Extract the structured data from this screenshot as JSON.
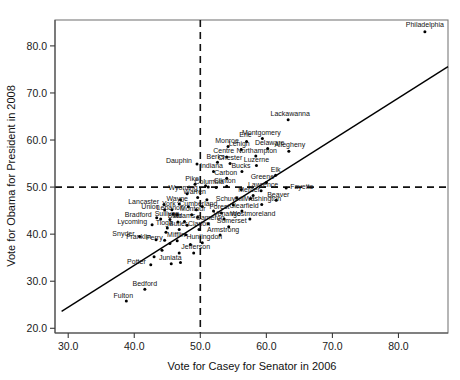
{
  "chart_data": {
    "type": "scatter",
    "title": "",
    "xlabel": "Vote for Casey for Senator in 2006",
    "ylabel": "Vote for Obama for President in 2008",
    "xlim": [
      28.0,
      87.5
    ],
    "ylim": [
      19.0,
      85.5
    ],
    "xticks": [
      "30.0",
      "40.0",
      "50.0",
      "60.0",
      "70.0",
      "80.0"
    ],
    "xtick_values": [
      30,
      40,
      50,
      60,
      70,
      80
    ],
    "yticks": [
      "20.0",
      "30.0",
      "40.0",
      "50.0",
      "60.0",
      "70.0",
      "80.0"
    ],
    "ytick_values": [
      20,
      30,
      40,
      50,
      60,
      70,
      80
    ],
    "grid": false,
    "legend": null,
    "reference_lines": [
      {
        "orientation": "vertical",
        "value": 50,
        "style": "dashed"
      },
      {
        "orientation": "horizontal",
        "value": 50,
        "style": "dashed"
      }
    ],
    "fit_line": {
      "style": "solid",
      "x0": 29.0,
      "y0": 23.6,
      "x1": 87.5,
      "y1": 75.6
    },
    "points": [
      {
        "label": "Philadelphia",
        "x": 84.0,
        "y": 83.0,
        "lx": 0,
        "ly": -5,
        "anchor": "middle"
      },
      {
        "label": "Lackawanna",
        "x": 63.3,
        "y": 64.3,
        "lx": 2,
        "ly": -4,
        "anchor": "middle"
      },
      {
        "label": "Montgomery",
        "x": 59.4,
        "y": 60.3,
        "lx": -1,
        "ly": -4,
        "anchor": "middle"
      },
      {
        "label": "Erie",
        "x": 57.0,
        "y": 59.7,
        "lx": -1,
        "ly": -4,
        "anchor": "middle"
      },
      {
        "label": "Delaware",
        "x": 60.2,
        "y": 58.2,
        "lx": 2,
        "ly": -3.5,
        "anchor": "middle"
      },
      {
        "label": "Allegheny",
        "x": 63.4,
        "y": 57.6,
        "lx": 1,
        "ly": -4,
        "anchor": "middle"
      },
      {
        "label": "Lehigh",
        "x": 56.2,
        "y": 58.0,
        "lx": -2,
        "ly": -3.5,
        "anchor": "middle"
      },
      {
        "label": "Monroe",
        "x": 54.2,
        "y": 58.6,
        "lx": -1,
        "ly": -4,
        "anchor": "middle"
      },
      {
        "label": "Northampton",
        "x": 58.4,
        "y": 56.6,
        "lx": 1,
        "ly": -3.5,
        "anchor": "middle"
      },
      {
        "label": "Centre",
        "x": 54.0,
        "y": 56.4,
        "lx": -3,
        "ly": -3.5,
        "anchor": "middle"
      },
      {
        "label": "Chester",
        "x": 54.5,
        "y": 55.0,
        "lx": 0,
        "ly": -3.5,
        "anchor": "middle"
      },
      {
        "label": "Berks",
        "x": 52.6,
        "y": 55.3,
        "lx": -2,
        "ly": -3.5,
        "anchor": "middle"
      },
      {
        "label": "Luzerne",
        "x": 58.5,
        "y": 54.6,
        "lx": 0,
        "ly": -3.5,
        "anchor": "middle"
      },
      {
        "label": "Dauphin",
        "x": 49.5,
        "y": 54.9,
        "lx": -5,
        "ly": -1,
        "anchor": "end"
      },
      {
        "label": "Bucks",
        "x": 56.3,
        "y": 53.3,
        "lx": -1,
        "ly": -3.5,
        "anchor": "middle"
      },
      {
        "label": "Indiana",
        "x": 52.0,
        "y": 53.3,
        "lx": -2,
        "ly": -3.5,
        "anchor": "middle"
      },
      {
        "label": "Carbon",
        "x": 54.0,
        "y": 51.9,
        "lx": -1,
        "ly": -3.5,
        "anchor": "middle"
      },
      {
        "label": "Elk",
        "x": 61.4,
        "y": 52.5,
        "lx": 0,
        "ly": -3.5,
        "anchor": "middle"
      },
      {
        "label": "Greene",
        "x": 60.0,
        "y": 51.0,
        "lx": -4,
        "ly": -3.5,
        "anchor": "middle"
      },
      {
        "label": "Clinton",
        "x": 54.0,
        "y": 50.2,
        "lx": -2,
        "ly": -3.5,
        "anchor": "middle"
      },
      {
        "label": "Pike",
        "x": 49.2,
        "y": 50.6,
        "lx": -3,
        "ly": -3.5,
        "anchor": "middle"
      },
      {
        "label": "Columbia",
        "x": 51.2,
        "y": 50.0,
        "lx": 1,
        "ly": -3.5,
        "anchor": "middle"
      },
      {
        "label": "Fayette",
        "x": 63.0,
        "y": 49.8,
        "lx": 4,
        "ly": 0.5,
        "anchor": "start"
      },
      {
        "label": "Lawrence",
        "x": 59.2,
        "y": 49.2,
        "lx": 2,
        "ly": -3.5,
        "anchor": "middle"
      },
      {
        "label": "Mercer",
        "x": 58.0,
        "y": 48.2,
        "lx": -4,
        "ly": -3.5,
        "anchor": "middle"
      },
      {
        "label": "Beaver",
        "x": 61.5,
        "y": 47.2,
        "lx": 2,
        "ly": -3.5,
        "anchor": "middle"
      },
      {
        "label": "Washington",
        "x": 59.3,
        "y": 46.3,
        "lx": 1,
        "ly": -3.5,
        "anchor": "middle"
      },
      {
        "label": "Schuylkill",
        "x": 55.0,
        "y": 46.2,
        "lx": -3,
        "ly": -3.5,
        "anchor": "middle"
      },
      {
        "label": "Clearfield",
        "x": 56.3,
        "y": 44.9,
        "lx": 2,
        "ly": -3.5,
        "anchor": "middle"
      },
      {
        "label": "Westmoreland",
        "x": 57.5,
        "y": 43.2,
        "lx": 3,
        "ly": -3.5,
        "anchor": "middle"
      },
      {
        "label": "Wyoming",
        "x": 48.0,
        "y": 48.6,
        "lx": -4,
        "ly": -3.5,
        "anchor": "middle"
      },
      {
        "label": "Warren",
        "x": 49.6,
        "y": 47.8,
        "lx": -3,
        "ly": -3.5,
        "anchor": "middle"
      },
      {
        "label": "Wayne",
        "x": 46.8,
        "y": 46.4,
        "lx": -2,
        "ly": -3.5,
        "anchor": "middle"
      },
      {
        "label": "Lancaster",
        "x": 44.5,
        "y": 46.3,
        "lx": -5,
        "ly": -0.5,
        "anchor": "end"
      },
      {
        "label": "York",
        "x": 45.7,
        "y": 45.2,
        "lx": -3,
        "ly": -3.5,
        "anchor": "middle"
      },
      {
        "label": "Cumberland",
        "x": 49.4,
        "y": 45.2,
        "lx": 2,
        "ly": -3.5,
        "anchor": "middle"
      },
      {
        "label": "Union",
        "x": 44.6,
        "y": 45.2,
        "lx": -5,
        "ly": -0.5,
        "anchor": "end"
      },
      {
        "label": "Forest",
        "x": 53.2,
        "y": 44.5,
        "lx": -2,
        "ly": -3.5,
        "anchor": "middle"
      },
      {
        "label": "Lebanon",
        "x": 45.9,
        "y": 44.3,
        "lx": -3,
        "ly": -3.5,
        "anchor": "middle"
      },
      {
        "label": "Montour",
        "x": 48.7,
        "y": 44.1,
        "lx": 1,
        "ly": -3.5,
        "anchor": "middle"
      },
      {
        "label": "Venango",
        "x": 53.6,
        "y": 43.2,
        "lx": 3,
        "ly": -3.5,
        "anchor": "middle"
      },
      {
        "label": "Bradford",
        "x": 43.4,
        "y": 43.5,
        "lx": -5,
        "ly": -0.5,
        "anchor": "end"
      },
      {
        "label": "Sullivan",
        "x": 45.4,
        "y": 43.1,
        "lx": -3,
        "ly": -3.5,
        "anchor": "middle"
      },
      {
        "label": "Blair",
        "x": 46.6,
        "y": 42.6,
        "lx": -3,
        "ly": -3.5,
        "anchor": "middle"
      },
      {
        "label": "Adams",
        "x": 47.6,
        "y": 42.7,
        "lx": 0,
        "ly": -3.5,
        "anchor": "middle"
      },
      {
        "label": "Cameron",
        "x": 51.2,
        "y": 42.2,
        "lx": 2,
        "ly": -3.5,
        "anchor": "middle"
      },
      {
        "label": "Somerset",
        "x": 54.3,
        "y": 41.6,
        "lx": 3,
        "ly": -3.5,
        "anchor": "middle"
      },
      {
        "label": "Lycoming",
        "x": 42.7,
        "y": 42.0,
        "lx": -5,
        "ly": -0.5,
        "anchor": "end"
      },
      {
        "label": "Tioga",
        "x": 45.0,
        "y": 41.3,
        "lx": -3,
        "ly": -3.5,
        "anchor": "middle"
      },
      {
        "label": "Butler",
        "x": 46.8,
        "y": 41.0,
        "lx": -1,
        "ly": -3.5,
        "anchor": "middle"
      },
      {
        "label": "Clarion",
        "x": 49.8,
        "y": 41.0,
        "lx": 0,
        "ly": -3.5,
        "anchor": "middle"
      },
      {
        "label": "Armstrong",
        "x": 53.0,
        "y": 39.8,
        "lx": 3,
        "ly": -3.5,
        "anchor": "middle"
      },
      {
        "label": "Snyder",
        "x": 40.8,
        "y": 39.5,
        "lx": -5,
        "ly": -0.5,
        "anchor": "end"
      },
      {
        "label": "Franklin",
        "x": 43.3,
        "y": 38.8,
        "lx": -5,
        "ly": -0.5,
        "anchor": "end"
      },
      {
        "label": "Perry",
        "x": 44.6,
        "y": 38.7,
        "lx": -2,
        "ly": -0.5,
        "anchor": "end"
      },
      {
        "label": "Mifflin",
        "x": 46.5,
        "y": 38.6,
        "lx": -1,
        "ly": -3.5,
        "anchor": "middle"
      },
      {
        "label": "Huntingdon",
        "x": 50.3,
        "y": 38.2,
        "lx": 2,
        "ly": -3.5,
        "anchor": "middle"
      },
      {
        "label": "Jefferson",
        "x": 49.0,
        "y": 36.0,
        "lx": 2,
        "ly": -3.5,
        "anchor": "middle"
      },
      {
        "label": "Potter",
        "x": 42.5,
        "y": 33.5,
        "lx": -5,
        "ly": -0.5,
        "anchor": "end"
      },
      {
        "label": "Juniata",
        "x": 45.6,
        "y": 33.7,
        "lx": -1,
        "ly": -3.5,
        "anchor": "middle"
      },
      {
        "label": "Bedford",
        "x": 41.6,
        "y": 28.3,
        "lx": 0,
        "ly": -3.5,
        "anchor": "middle"
      },
      {
        "label": "Fulton",
        "x": 38.8,
        "y": 25.8,
        "lx": -3,
        "ly": -3.0,
        "anchor": "middle"
      }
    ],
    "unlabeled_points": [
      {
        "x": 50.8,
        "y": 50.3
      },
      {
        "x": 52.4,
        "y": 49.9
      },
      {
        "x": 56.2,
        "y": 49.5
      },
      {
        "x": 47.0,
        "y": 47.3
      },
      {
        "x": 51.0,
        "y": 47.3
      },
      {
        "x": 55.5,
        "y": 47.7
      },
      {
        "x": 57.6,
        "y": 47.6
      },
      {
        "x": 48.2,
        "y": 45.8
      },
      {
        "x": 50.3,
        "y": 45.9
      },
      {
        "x": 46.5,
        "y": 44.2
      },
      {
        "x": 52.0,
        "y": 44.9
      },
      {
        "x": 44.0,
        "y": 43.2
      },
      {
        "x": 49.6,
        "y": 43.6
      },
      {
        "x": 48.0,
        "y": 41.9
      },
      {
        "x": 44.8,
        "y": 40.4
      },
      {
        "x": 47.8,
        "y": 39.9
      },
      {
        "x": 45.4,
        "y": 38.0
      },
      {
        "x": 48.5,
        "y": 37.8
      },
      {
        "x": 44.2,
        "y": 36.6
      },
      {
        "x": 46.8,
        "y": 36.0
      },
      {
        "x": 43.0,
        "y": 35.2
      },
      {
        "x": 47.0,
        "y": 34.0
      }
    ]
  },
  "axes": {
    "x_title": "Vote for Casey for Senator in 2006",
    "y_title": "Vote for Obama for President in 2008"
  }
}
